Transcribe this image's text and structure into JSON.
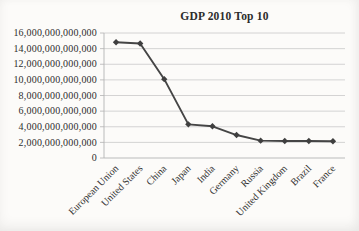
{
  "page": {
    "background_color": "#fcfbf9"
  },
  "chart_data": {
    "type": "line",
    "title": "GDP 2010 Top 10",
    "xlabel": "",
    "ylabel": "",
    "legend": "none",
    "grid": true,
    "marker": "diamond",
    "ylim": [
      0,
      16000000000000
    ],
    "categories": [
      "European Union",
      "United States",
      "China",
      "Japan",
      "India",
      "Germany",
      "Russia",
      "United Kingdom",
      "Brazil",
      "France"
    ],
    "series": [
      {
        "name": "GDP 2010",
        "values": [
          14820000000000,
          14660000000000,
          10090000000000,
          4310000000000,
          4060000000000,
          2940000000000,
          2220000000000,
          2170000000000,
          2170000000000,
          2150000000000
        ]
      }
    ],
    "yticks": [
      {
        "value": 0,
        "label": "0"
      },
      {
        "value": 2000000000000,
        "label": "2,000,000,000,000"
      },
      {
        "value": 4000000000000,
        "label": "4,000,000,000,000"
      },
      {
        "value": 6000000000000,
        "label": "6,000,000,000,000"
      },
      {
        "value": 8000000000000,
        "label": "8,000,000,000,000"
      },
      {
        "value": 10000000000000,
        "label": "10,000,000,000,000"
      },
      {
        "value": 12000000000000,
        "label": "12,000,000,000,000"
      },
      {
        "value": 14000000000000,
        "label": "14,000,000,000,000"
      },
      {
        "value": 16000000000000,
        "label": "16,000,000,000,000"
      }
    ],
    "colors": {
      "line": "#454545",
      "marker": "#3f3f3f",
      "grid": "#c9c9c9",
      "axis": "#b3b3b3",
      "text": "#2e2e2e",
      "background": "#fcfbf9"
    }
  }
}
